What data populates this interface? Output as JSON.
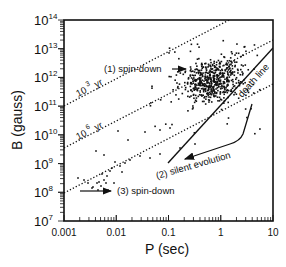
{
  "chart_data": {
    "type": "scatter",
    "title": "",
    "xlabel": "P (sec)",
    "ylabel": "B (gauss)",
    "xscale": "log",
    "yscale": "log",
    "xlim": [
      0.001,
      10
    ],
    "ylim": [
      10000000.0,
      100000000000000.0
    ],
    "x_ticks": [
      "0.001",
      "0.01",
      "0.1",
      "1",
      "10"
    ],
    "y_ticks": [
      {
        "base": "10",
        "exp": "7"
      },
      {
        "base": "10",
        "exp": "8"
      },
      {
        "base": "10",
        "exp": "9"
      },
      {
        "base": "10",
        "exp": "10"
      },
      {
        "base": "10",
        "exp": "11"
      },
      {
        "base": "10",
        "exp": "12"
      },
      {
        "base": "10",
        "exp": "13"
      },
      {
        "base": "10",
        "exp": "14"
      }
    ],
    "grid": false,
    "age_lines": [
      {
        "label_base": "10",
        "label_exp": "3",
        "label_unit": "yr"
      },
      {
        "label_base": "10",
        "label_exp": "6",
        "label_unit": "yr"
      },
      {
        "label_base": "",
        "label_exp": "",
        "label_unit": ""
      }
    ],
    "annotations": {
      "spin_down_1": "(1) spin-down",
      "silent_evolution": "(2) silent evolution",
      "spin_down_3": "(3) spin-down",
      "death_line": "death line"
    },
    "series": [
      {
        "name": "pulsars",
        "description": "dense cluster of normal pulsars centered near P≈0.5 s, B≈10^12 G; sparse millisecond pulsars near P≈0.002–0.01 s, B≈10^8–10^9 G"
      }
    ]
  }
}
